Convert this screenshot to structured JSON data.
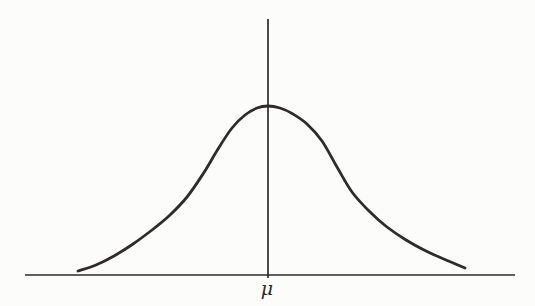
{
  "figure": {
    "type": "normal-distribution-sketch",
    "background_color": "#fcfcfa",
    "ink_color": "#2e2c2a",
    "canvas": {
      "width": 535,
      "height": 306
    },
    "axes": {
      "vertical": {
        "x": 268,
        "y1": 19,
        "y2": 278,
        "stroke_width": 1.7
      },
      "horizontal": {
        "y": 275,
        "x1": 25,
        "x2": 515,
        "stroke_width": 1.7
      }
    },
    "curve": {
      "stroke_width": 2.8,
      "points": [
        [
          78,
          271
        ],
        [
          96,
          265
        ],
        [
          114,
          256
        ],
        [
          133,
          244
        ],
        [
          152,
          230
        ],
        [
          170,
          215
        ],
        [
          187,
          197
        ],
        [
          203,
          174
        ],
        [
          218,
          149
        ],
        [
          232,
          128
        ],
        [
          245,
          115
        ],
        [
          257,
          108
        ],
        [
          268,
          106
        ],
        [
          280,
          108
        ],
        [
          293,
          114
        ],
        [
          307,
          124
        ],
        [
          322,
          141
        ],
        [
          337,
          167
        ],
        [
          352,
          192
        ],
        [
          369,
          211
        ],
        [
          387,
          227
        ],
        [
          406,
          240
        ],
        [
          426,
          251
        ],
        [
          446,
          260
        ],
        [
          465,
          268
        ]
      ]
    },
    "labels": {
      "mean": {
        "text": "μ",
        "x": 267,
        "y": 295,
        "font_size": 19
      }
    }
  }
}
